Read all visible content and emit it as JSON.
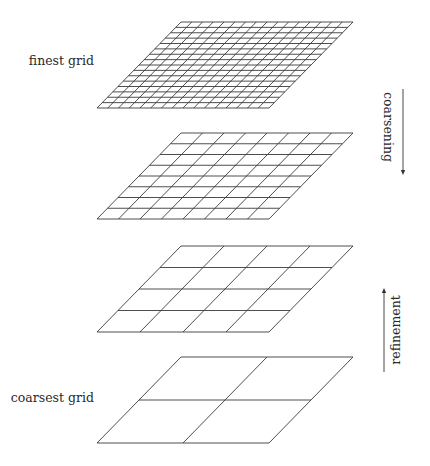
{
  "diagram": {
    "type": "multigrid-hierarchy",
    "labels": {
      "finest": "finest grid",
      "coarsest": "coarsest grid",
      "coarsening": "coarsening",
      "refinement": "refinement"
    },
    "grids": [
      {
        "name": "finest",
        "divisions": 16,
        "top_y": 22
      },
      {
        "name": "level-2",
        "divisions": 8,
        "top_y": 133
      },
      {
        "name": "level-3",
        "divisions": 4,
        "top_y": 246
      },
      {
        "name": "coarsest",
        "divisions": 2,
        "top_y": 357
      }
    ],
    "geometry": {
      "top_left_x": 181,
      "top_right_x": 353,
      "bottom_left_x": 97,
      "bottom_right_x": 269,
      "height": 86
    },
    "arrows": [
      {
        "name": "coarsening",
        "direction": "down",
        "x": 403,
        "y_start": 89,
        "y_end": 175
      },
      {
        "name": "refinement",
        "direction": "up",
        "x": 384,
        "y_start": 372,
        "y_end": 288
      }
    ],
    "colors": {
      "line": "#3a3a3a",
      "background": "#ffffff",
      "text": "#2a2a2a"
    }
  }
}
